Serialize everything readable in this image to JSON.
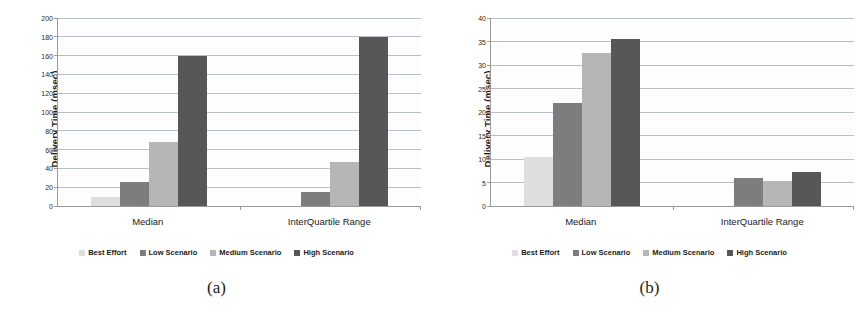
{
  "figure": {
    "panels": [
      {
        "caption": "(a)",
        "chart_data": {
          "type": "bar",
          "title": "",
          "xlabel": "",
          "ylabel": "Delivery Time (msec)",
          "categories": [
            "Median",
            "InterQuartile Range"
          ],
          "series": [
            {
              "name": "Best Effort",
              "values": [
                10,
                0
              ],
              "color": "#dedede"
            },
            {
              "name": "Low Scenario",
              "values": [
                26,
                15
              ],
              "color": "#7d7d7d"
            },
            {
              "name": "Medium Scenario",
              "values": [
                68,
                47
              ],
              "color": "#b6b6b6"
            },
            {
              "name": "High Scenario",
              "values": [
                160,
                180
              ],
              "color": "#575757"
            }
          ],
          "ylim": [
            0,
            200
          ],
          "ytick_step": 20,
          "yticks": [
            "0",
            "20",
            "40",
            "60",
            "80",
            "100",
            "120",
            "140",
            "160",
            "180",
            "200"
          ],
          "grid": true,
          "legend_position": "bottom"
        }
      },
      {
        "caption": "(b)",
        "chart_data": {
          "type": "bar",
          "title": "",
          "xlabel": "",
          "ylabel": "Delivery Time (msec)",
          "categories": [
            "Median",
            "InterQuartile Range"
          ],
          "series": [
            {
              "name": "Best Effort",
              "values": [
                10.5,
                0
              ],
              "color": "#dedede"
            },
            {
              "name": "Low Scenario",
              "values": [
                22,
                6.0
              ],
              "color": "#7d7d7d"
            },
            {
              "name": "Medium Scenario",
              "values": [
                32.5,
                5.3
              ],
              "color": "#b6b6b6"
            },
            {
              "name": "High Scenario",
              "values": [
                35.5,
                7.2
              ],
              "color": "#575757"
            }
          ],
          "ylim": [
            0,
            40
          ],
          "ytick_step": 5,
          "yticks": [
            "0",
            "5",
            "10",
            "15",
            "20",
            "25",
            "30",
            "35",
            "40"
          ],
          "grid": true,
          "legend_position": "bottom"
        }
      }
    ]
  }
}
